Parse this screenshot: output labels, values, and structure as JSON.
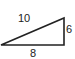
{
  "diagram": {
    "shape": "right-triangle",
    "labels": {
      "hypotenuse": "10",
      "vertical_leg": "6",
      "base": "8"
    },
    "stroke_color": "#222222"
  }
}
